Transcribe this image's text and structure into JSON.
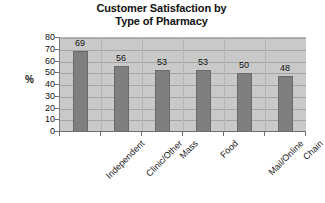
{
  "chart_data": {
    "type": "bar",
    "title": "Customer Satisfaction by Type of Pharmacy",
    "title_lines": [
      "Customer Satisfaction by",
      "Type of Pharmacy"
    ],
    "categories": [
      "Independent",
      "Clinic/Other",
      "Mass",
      "Food",
      "Mail/Online",
      "Chain"
    ],
    "values": [
      69,
      56,
      53,
      53,
      50,
      48
    ],
    "xlabel": "",
    "ylabel": "%",
    "ylim": [
      0,
      80
    ],
    "ytick_values": [
      "80",
      "70",
      "60",
      "50",
      "40",
      "30",
      "20",
      "10",
      "0"
    ],
    "grid": true,
    "legend": "none",
    "data_labels": [
      "69",
      "56",
      "53",
      "53",
      "50",
      "48"
    ],
    "colors": {
      "bar_fill": "#7f7f7f",
      "bar_border": "#6a6a6a",
      "plot_background": "#c9c9c9",
      "gridline": "#a4a4a4",
      "axis": "#6e6e6e",
      "text": "#111111",
      "page_background": "#ffffff"
    }
  }
}
